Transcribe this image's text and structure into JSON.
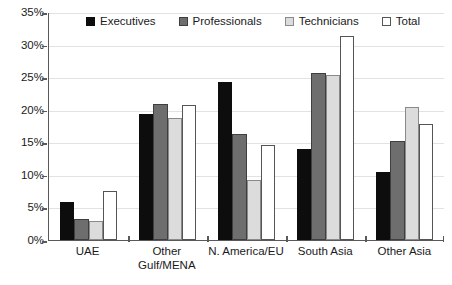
{
  "chart_data": {
    "type": "bar",
    "title": "",
    "subtitle": "",
    "xlabel": "",
    "ylabel": "",
    "ylim": [
      0,
      35
    ],
    "ytick_values": [
      0,
      5,
      10,
      15,
      20,
      25,
      30,
      35
    ],
    "ytick_labels": [
      "0%",
      "5%",
      "10%",
      "15%",
      "20%",
      "25%",
      "30%",
      "35%"
    ],
    "grid": true,
    "legend_position": "top-inside",
    "categories": [
      "UAE",
      "Other\nGulf/MENA",
      "N. America/EU",
      "South Asia",
      "Other Asia"
    ],
    "series": [
      {
        "name": "Executives",
        "color": "#0d0d0d",
        "values": [
          5.8,
          19.4,
          24.3,
          14.0,
          10.4
        ]
      },
      {
        "name": "Professionals",
        "color": "#6e6e6e",
        "values": [
          3.3,
          20.9,
          16.2,
          25.7,
          15.2
        ]
      },
      {
        "name": "Technicians",
        "color": "#dcdcdc",
        "values": [
          2.9,
          18.7,
          9.2,
          25.3,
          20.4
        ]
      },
      {
        "name": "Total",
        "color": "#ffffff",
        "values": [
          7.5,
          20.7,
          14.6,
          31.3,
          17.8
        ]
      }
    ]
  },
  "legend": {
    "items": [
      {
        "label": "Executives"
      },
      {
        "label": "Professionals"
      },
      {
        "label": "Technicians"
      },
      {
        "label": "Total"
      }
    ]
  }
}
